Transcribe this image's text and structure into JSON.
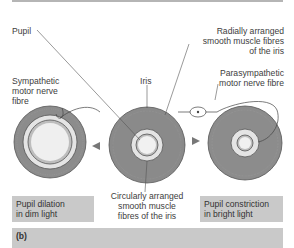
{
  "figure": {
    "panel_label": "(b)",
    "labels": {
      "pupil": "Pupil",
      "radial_fibres": [
        "Radially arranged",
        "smooth muscle fibres",
        "of the iris"
      ],
      "iris": "Iris",
      "sympathetic": [
        "Sympathetic",
        "motor nerve",
        "fibre"
      ],
      "parasympathetic": [
        "Parasympathetic",
        "motor nerve fibre"
      ],
      "circular_fibres": [
        "Circularly arranged",
        "smooth muscle",
        "fibres of the iris"
      ]
    },
    "captions": {
      "dilation": [
        "Pupil dilation",
        "in dim light"
      ],
      "constriction": [
        "Pupil constriction",
        "in bright light"
      ]
    },
    "colors": {
      "iris_dark": "#8a8a8a",
      "iris_light": "#e6e6e6",
      "caption_bg": "#c9c9c9",
      "line": "#4a4a4a"
    }
  }
}
